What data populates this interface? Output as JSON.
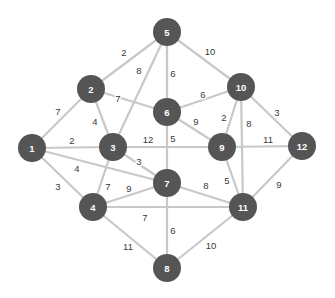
{
  "figure": {
    "type": "graph-diagram",
    "width": 335,
    "height": 298,
    "background_color": "#ffffff",
    "node_color": "#555555",
    "node_label_color": "#ffffff",
    "edge_color": "#c8c8c8",
    "edge_label_color": "#3a3a3a",
    "node_radius": 14
  },
  "chart_data": {
    "type": "graph",
    "title": "",
    "directed": false,
    "weighted": true,
    "node_count": 12,
    "edge_count": 26,
    "nodes": [
      {
        "id": "1",
        "label": "1",
        "x": 32,
        "y": 148
      },
      {
        "id": "2",
        "label": "2",
        "x": 91,
        "y": 89
      },
      {
        "id": "3",
        "label": "3",
        "x": 113,
        "y": 147
      },
      {
        "id": "4",
        "label": "4",
        "x": 93,
        "y": 207
      },
      {
        "id": "5",
        "label": "5",
        "x": 167,
        "y": 32
      },
      {
        "id": "6",
        "label": "6",
        "x": 167,
        "y": 112
      },
      {
        "id": "7",
        "label": "7",
        "x": 167,
        "y": 183
      },
      {
        "id": "8",
        "label": "8",
        "x": 167,
        "y": 268
      },
      {
        "id": "9",
        "label": "9",
        "x": 222,
        "y": 147
      },
      {
        "id": "10",
        "label": "10",
        "x": 241,
        "y": 87
      },
      {
        "id": "11",
        "label": "11",
        "x": 243,
        "y": 207
      },
      {
        "id": "12",
        "label": "12",
        "x": 302,
        "y": 146
      }
    ],
    "edges": [
      {
        "source": "1",
        "target": "2",
        "weight": 7,
        "label": "7",
        "lx": 58,
        "ly": 111
      },
      {
        "source": "1",
        "target": "3",
        "weight": 2,
        "label": "2",
        "lx": 72,
        "ly": 140
      },
      {
        "source": "1",
        "target": "7",
        "weight": 4,
        "label": "4",
        "lx": 77,
        "ly": 168
      },
      {
        "source": "1",
        "target": "4",
        "weight": 3,
        "label": "3",
        "lx": 58,
        "ly": 186
      },
      {
        "source": "2",
        "target": "3",
        "weight": 4,
        "label": "4",
        "lx": 95,
        "ly": 121
      },
      {
        "source": "2",
        "target": "5",
        "weight": 2,
        "label": "2",
        "lx": 124,
        "ly": 52
      },
      {
        "source": "2",
        "target": "6",
        "weight": 7,
        "label": "7",
        "lx": 118,
        "ly": 98
      },
      {
        "source": "3",
        "target": "4",
        "weight": 7,
        "label": "7",
        "lx": 108,
        "ly": 186
      },
      {
        "source": "3",
        "target": "5",
        "weight": 8,
        "label": "8",
        "lx": 139,
        "ly": 70
      },
      {
        "source": "3",
        "target": "7",
        "weight": 3,
        "label": "3",
        "lx": 139,
        "ly": 161
      },
      {
        "source": "3",
        "target": "9",
        "weight": 12,
        "label": "12",
        "lx": 148,
        "ly": 139
      },
      {
        "source": "4",
        "target": "7",
        "weight": 9,
        "label": "9",
        "lx": 129,
        "ly": 188
      },
      {
        "source": "4",
        "target": "11",
        "weight": 7,
        "label": "7",
        "lx": 145,
        "ly": 217
      },
      {
        "source": "4",
        "target": "8",
        "weight": 11,
        "label": "11",
        "lx": 128,
        "ly": 246
      },
      {
        "source": "5",
        "target": "6",
        "weight": 6,
        "label": "6",
        "lx": 173,
        "ly": 73
      },
      {
        "source": "5",
        "target": "7",
        "weight": 5,
        "label": "5",
        "lx": 173,
        "ly": 138
      },
      {
        "source": "5",
        "target": "10",
        "weight": 10,
        "label": "10",
        "lx": 210,
        "ly": 51
      },
      {
        "source": "6",
        "target": "9",
        "weight": 9,
        "label": "9",
        "lx": 196,
        "ly": 121
      },
      {
        "source": "6",
        "target": "10",
        "weight": 6,
        "label": "6",
        "lx": 203,
        "ly": 94
      },
      {
        "source": "7",
        "target": "8",
        "weight": 6,
        "label": "6",
        "lx": 173,
        "ly": 230
      },
      {
        "source": "7",
        "target": "11",
        "weight": 8,
        "label": "8",
        "lx": 206,
        "ly": 185
      },
      {
        "source": "8",
        "target": "11",
        "weight": 10,
        "label": "10",
        "lx": 211,
        "ly": 245
      },
      {
        "source": "9",
        "target": "10",
        "weight": 2,
        "label": "2",
        "lx": 224,
        "ly": 117
      },
      {
        "source": "9",
        "target": "11",
        "weight": 5,
        "label": "5",
        "lx": 227,
        "ly": 180
      },
      {
        "source": "9",
        "target": "12",
        "weight": 11,
        "label": "11",
        "lx": 268,
        "ly": 139
      },
      {
        "source": "10",
        "target": "11",
        "weight": 8,
        "label": "8",
        "lx": 249,
        "ly": 123
      },
      {
        "source": "10",
        "target": "12",
        "weight": 3,
        "label": "3",
        "lx": 277,
        "ly": 112
      },
      {
        "source": "11",
        "target": "12",
        "weight": 9,
        "label": "9",
        "lx": 279,
        "ly": 184
      }
    ]
  }
}
